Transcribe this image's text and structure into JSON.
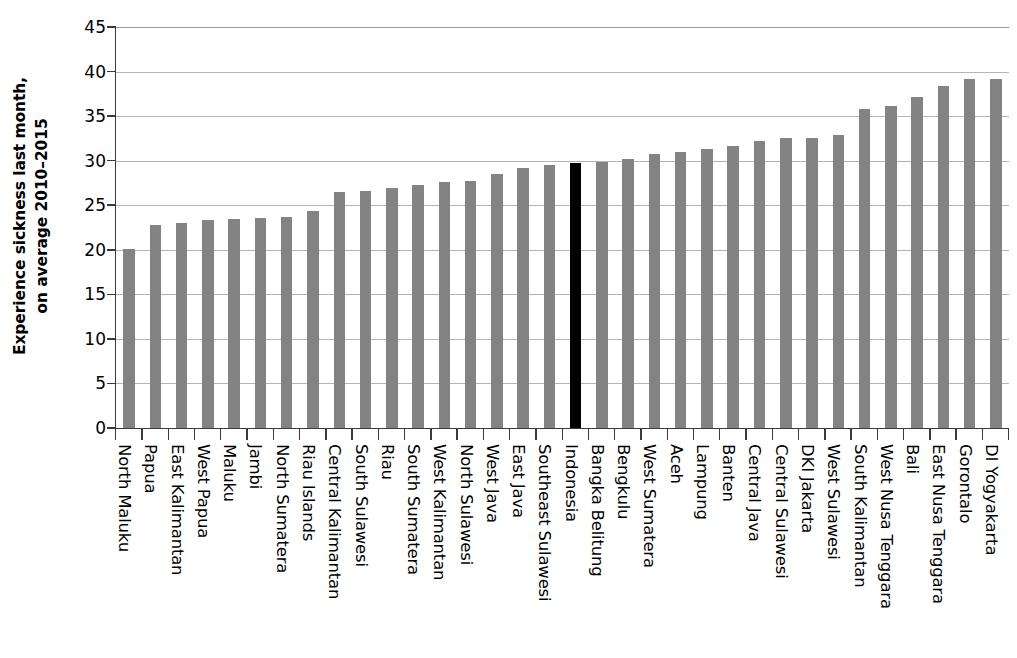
{
  "chart_data": {
    "type": "bar",
    "title": "",
    "subtitle": "",
    "xlabel": "",
    "ylabel": "Experience sickness last month, on average 2010–2015",
    "ylabel_lines": [
      "Experience sickness last month,",
      "on average 2010–2015"
    ],
    "ylim": [
      0,
      45
    ],
    "ytick_values": [
      0,
      5,
      10,
      15,
      20,
      25,
      30,
      35,
      40,
      45
    ],
    "ytick_labels": [
      "0",
      "5",
      "10",
      "15",
      "20",
      "25",
      "30",
      "35",
      "40",
      "45"
    ],
    "grid": true,
    "grid_axis": "y",
    "legend": false,
    "legend_position": "none",
    "bar_color": "#838383",
    "highlight_color": "#000000",
    "highlight_category": "Indonesia",
    "categories": [
      "North Maluku",
      "Papua",
      "East Kalimantan",
      "West Papua",
      "Maluku",
      "Jambi",
      "North Sumatera",
      "Riau Islands",
      "Central Kalimantan",
      "South Sulawesi",
      "Riau",
      "South Sumatera",
      "West Kalimantan",
      "North Sulawesi",
      "West Java",
      "East Java",
      "Southeast Sulawesi",
      "Indonesia",
      "Bangka Belitung",
      "Bengkulu",
      "West Sumatera",
      "Aceh",
      "Lampung",
      "Banten",
      "Central Java",
      "Central Sulawesi",
      "DKI Jakarta",
      "West Sulawesi",
      "South Kalimantan",
      "West Nusa Tenggara",
      "Bali",
      "East Nusa Tenggara",
      "Gorontalo",
      "DI Yogyakarta"
    ],
    "values": [
      20.1,
      22.8,
      23.0,
      23.3,
      23.4,
      23.6,
      23.7,
      24.3,
      26.5,
      26.6,
      26.9,
      27.3,
      27.6,
      27.7,
      28.5,
      29.2,
      29.5,
      29.7,
      29.9,
      30.2,
      30.7,
      31.0,
      31.3,
      31.6,
      32.2,
      32.6,
      32.6,
      32.9,
      35.8,
      36.1,
      37.1,
      38.4,
      39.2,
      39.2
    ]
  }
}
